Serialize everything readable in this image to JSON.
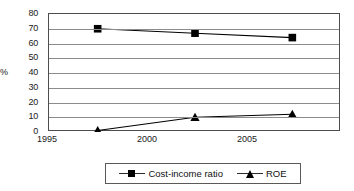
{
  "chart_data": {
    "type": "line",
    "title": "",
    "xlabel": "",
    "ylabel": "%",
    "categories": [
      "1995",
      "2000",
      "2005"
    ],
    "x": [
      1995,
      2000,
      2005
    ],
    "ylim": [
      0,
      80
    ],
    "ytick_step": 10,
    "yticks": [
      "80",
      "70",
      "60",
      "50",
      "40",
      "30",
      "20",
      "10",
      "0"
    ],
    "grid": true,
    "grid_axis": "y",
    "legend_position": "bottom",
    "series": [
      {
        "name": "Cost-income ratio",
        "marker": "square",
        "color": "#000000",
        "values": [
          70,
          67,
          64
        ]
      },
      {
        "name": "ROE",
        "marker": "triangle",
        "color": "#000000",
        "values": [
          1,
          10,
          12
        ]
      }
    ]
  },
  "axis": {
    "y_label": "%",
    "y_ticks": [
      "80",
      "70",
      "60",
      "50",
      "40",
      "30",
      "20",
      "10",
      "0"
    ],
    "x_ticks": [
      "1995",
      "2000",
      "2005"
    ]
  },
  "legend": {
    "items": [
      {
        "label": "Cost-income ratio",
        "marker": "square-marker"
      },
      {
        "label": "ROE",
        "marker": "triangle-marker"
      }
    ]
  }
}
